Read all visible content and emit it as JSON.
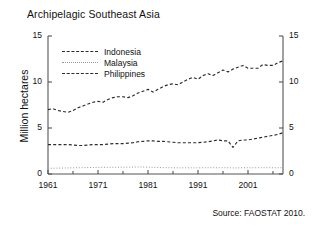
{
  "chart_data": {
    "type": "line",
    "title": "Archipelagic Southeast Asia",
    "xlabel": "",
    "ylabel": "Million hectares",
    "xlim": [
      1961,
      2008
    ],
    "ylim": [
      0,
      15
    ],
    "yticks": [
      0,
      5,
      10,
      15
    ],
    "ytick_labels_left": [
      "0",
      "5",
      "10",
      "15"
    ],
    "ytick_labels_right": [
      "0",
      "5",
      "10",
      "15"
    ],
    "xticks": [
      1961,
      1971,
      1981,
      1991,
      2001
    ],
    "xtick_labels": [
      "1961",
      "1971",
      "1981",
      "1991",
      "2001"
    ],
    "grid": false,
    "legend_position": "upper-left-inside",
    "annotation": "Source: FAOSTAT 2010.",
    "x": [
      1961,
      1962,
      1963,
      1964,
      1965,
      1966,
      1967,
      1968,
      1969,
      1970,
      1971,
      1972,
      1973,
      1974,
      1975,
      1976,
      1977,
      1978,
      1979,
      1980,
      1981,
      1982,
      1983,
      1984,
      1985,
      1986,
      1987,
      1988,
      1989,
      1990,
      1991,
      1992,
      1993,
      1994,
      1995,
      1996,
      1997,
      1998,
      1999,
      2000,
      2001,
      2002,
      2003,
      2004,
      2005,
      2006,
      2007,
      2008
    ],
    "series": [
      {
        "name": "Indonesia",
        "color": "#2b2b2b",
        "style": "dashed",
        "values": [
          7.0,
          7.1,
          6.9,
          6.8,
          6.7,
          6.9,
          7.2,
          7.4,
          7.6,
          7.8,
          7.9,
          7.8,
          8.1,
          8.3,
          8.4,
          8.4,
          8.3,
          8.5,
          8.8,
          9.0,
          9.2,
          8.9,
          9.2,
          9.5,
          9.7,
          9.8,
          9.7,
          10.0,
          10.3,
          10.5,
          10.3,
          10.7,
          10.9,
          10.7,
          11.0,
          11.3,
          11.1,
          11.4,
          11.6,
          11.8,
          11.5,
          11.5,
          11.5,
          11.9,
          11.8,
          11.8,
          12.1,
          12.3
        ]
      },
      {
        "name": "Malaysia",
        "color": "#9a9a9a",
        "style": "dotted",
        "values": [
          0.62,
          0.63,
          0.64,
          0.65,
          0.66,
          0.67,
          0.68,
          0.69,
          0.7,
          0.71,
          0.72,
          0.72,
          0.73,
          0.73,
          0.74,
          0.74,
          0.75,
          0.75,
          0.76,
          0.76,
          0.74,
          0.72,
          0.7,
          0.69,
          0.68,
          0.68,
          0.67,
          0.67,
          0.67,
          0.67,
          0.67,
          0.68,
          0.68,
          0.68,
          0.68,
          0.68,
          0.68,
          0.66,
          0.67,
          0.68,
          0.68,
          0.68,
          0.68,
          0.68,
          0.68,
          0.68,
          0.68,
          0.68
        ]
      },
      {
        "name": "Philippines",
        "color": "#2b2b2b",
        "style": "dashed",
        "values": [
          3.2,
          3.2,
          3.2,
          3.2,
          3.2,
          3.15,
          3.1,
          3.1,
          3.15,
          3.2,
          3.2,
          3.2,
          3.25,
          3.3,
          3.3,
          3.3,
          3.35,
          3.4,
          3.5,
          3.55,
          3.6,
          3.6,
          3.55,
          3.55,
          3.5,
          3.45,
          3.4,
          3.4,
          3.4,
          3.4,
          3.4,
          3.45,
          3.5,
          3.6,
          3.7,
          3.6,
          3.6,
          2.9,
          3.6,
          3.7,
          3.7,
          3.8,
          3.9,
          4.0,
          4.1,
          4.2,
          4.3,
          4.5
        ]
      }
    ]
  },
  "legend": {
    "items": [
      {
        "label": "Indonesia"
      },
      {
        "label": "Malaysia"
      },
      {
        "label": "Philippines"
      }
    ]
  },
  "source": {
    "text": "Source: FAOSTAT 2010."
  }
}
